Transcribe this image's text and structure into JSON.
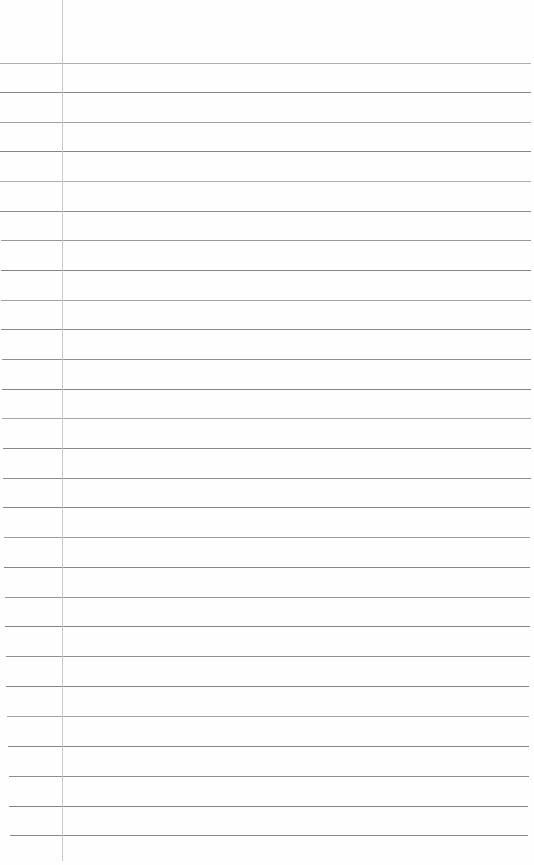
{
  "document": {
    "kind": "lined-notebook-page",
    "title": "Blank Lined Notebook Page",
    "page_width": 534,
    "page_height": 865,
    "background_color": "#ffffff",
    "paper_color": "#fefefe",
    "content_text": "",
    "is_blank": true
  },
  "margin_rule": {
    "name": "vertical-margin-rule",
    "x": 62,
    "top": 0,
    "height": 861,
    "color": "#c9c9c9",
    "thickness": 1
  },
  "ruling": {
    "line_color": "#7d7d7d",
    "line_thickness": 1,
    "line_count": 27,
    "first_line_y": 63,
    "line_spacing": 29.7,
    "top_margin": 63,
    "left_inset_top": 0,
    "left_inset_bottom": 10,
    "right_end_top": 531,
    "right_end_bottom": 528,
    "lines": [
      {
        "y": 63,
        "left": 0,
        "right": 531,
        "opacity": 0.62
      },
      {
        "y": 92,
        "left": 0,
        "right": 531,
        "opacity": 0.92
      },
      {
        "y": 122,
        "left": 0,
        "right": 531,
        "opacity": 0.72
      },
      {
        "y": 151,
        "left": 0,
        "right": 531,
        "opacity": 0.95
      },
      {
        "y": 181,
        "left": 0,
        "right": 531,
        "opacity": 0.6
      },
      {
        "y": 211,
        "left": 0,
        "right": 531,
        "opacity": 0.88
      },
      {
        "y": 240,
        "left": 1,
        "right": 531,
        "opacity": 0.8
      },
      {
        "y": 270,
        "left": 1,
        "right": 531,
        "opacity": 0.95
      },
      {
        "y": 300,
        "left": 1,
        "right": 531,
        "opacity": 0.7
      },
      {
        "y": 329,
        "left": 1,
        "right": 531,
        "opacity": 0.9
      },
      {
        "y": 359,
        "left": 2,
        "right": 531,
        "opacity": 0.85
      },
      {
        "y": 389,
        "left": 2,
        "right": 531,
        "opacity": 0.95
      },
      {
        "y": 418,
        "left": 2,
        "right": 531,
        "opacity": 0.68
      },
      {
        "y": 448,
        "left": 3,
        "right": 531,
        "opacity": 0.9
      },
      {
        "y": 478,
        "left": 3,
        "right": 531,
        "opacity": 0.88
      },
      {
        "y": 507,
        "left": 3,
        "right": 530,
        "opacity": 0.95
      },
      {
        "y": 537,
        "left": 4,
        "right": 530,
        "opacity": 0.75
      },
      {
        "y": 567,
        "left": 4,
        "right": 530,
        "opacity": 0.92
      },
      {
        "y": 597,
        "left": 5,
        "right": 530,
        "opacity": 0.8
      },
      {
        "y": 626,
        "left": 5,
        "right": 530,
        "opacity": 0.95
      },
      {
        "y": 656,
        "left": 6,
        "right": 530,
        "opacity": 0.85
      },
      {
        "y": 686,
        "left": 6,
        "right": 529,
        "opacity": 0.95
      },
      {
        "y": 716,
        "left": 7,
        "right": 529,
        "opacity": 0.7
      },
      {
        "y": 746,
        "left": 8,
        "right": 529,
        "opacity": 0.92
      },
      {
        "y": 776,
        "left": 9,
        "right": 529,
        "opacity": 0.88
      },
      {
        "y": 806,
        "left": 9,
        "right": 528,
        "opacity": 0.95
      },
      {
        "y": 835,
        "left": 10,
        "right": 528,
        "opacity": 0.9
      }
    ]
  }
}
